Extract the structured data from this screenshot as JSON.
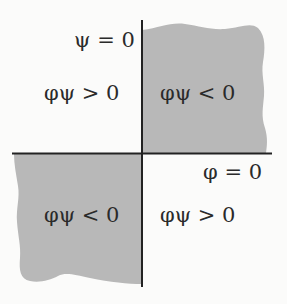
{
  "diagram": {
    "colors": {
      "background": "#fbfbfa",
      "shaded_region": "#b8b8b8",
      "axis": "#222222",
      "text": "#2a2a2a"
    },
    "axes": {
      "vertical_label": "ψ = 0",
      "horizontal_label": "φ = 0"
    },
    "quadrants": {
      "top_left": {
        "label": "φψ > 0",
        "shaded": false
      },
      "top_right": {
        "label": "φψ < 0",
        "shaded": true
      },
      "bottom_left": {
        "label": "φψ < 0",
        "shaded": true
      },
      "bottom_right": {
        "label": "φψ > 0",
        "shaded": false
      }
    }
  }
}
